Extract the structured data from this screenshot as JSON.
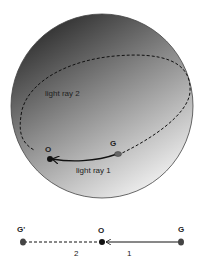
{
  "sphere_diagram": {
    "labels": {
      "observer": "O",
      "galaxy": "G",
      "ray1": "light ray 1",
      "ray2": "light ray 2"
    }
  },
  "linear_diagram": {
    "labels": {
      "image": "G'",
      "observer": "O",
      "galaxy": "G",
      "segment2": "2",
      "segment1": "1"
    }
  },
  "colors": {
    "sphere_dark": "#3a3a3a",
    "sphere_light": "#e6e6e6",
    "line": "#111111"
  }
}
